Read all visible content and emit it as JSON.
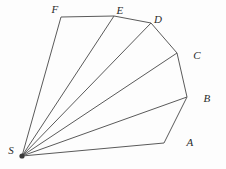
{
  "figure": {
    "kind": "geometry-diagram",
    "title": "",
    "background_color": "#fdfdfd",
    "stroke_color": "#5a5a5a",
    "label_color": "#2b2b2b",
    "apex_point_color": "#3a3a3a",
    "width": 226,
    "height": 169
  },
  "chart_data": {
    "type": "scatter",
    "title": "",
    "xlabel": "",
    "ylabel": "",
    "grid": false,
    "legend": null,
    "points": [
      {
        "label": "S",
        "x": 22,
        "y": 156,
        "label_x": 11,
        "label_y": 150
      },
      {
        "label": "A",
        "x": 164,
        "y": 143,
        "label_x": 190,
        "label_y": 142
      },
      {
        "label": "B",
        "x": 187,
        "y": 97,
        "label_x": 207,
        "label_y": 98
      },
      {
        "label": "C",
        "x": 177,
        "y": 53,
        "label_x": 197,
        "label_y": 55
      },
      {
        "label": "D",
        "x": 151,
        "y": 23,
        "label_x": 158,
        "label_y": 19
      },
      {
        "label": "E",
        "x": 114,
        "y": 16,
        "label_x": 120,
        "label_y": 10
      },
      {
        "label": "F",
        "x": 61,
        "y": 17,
        "label_x": 55,
        "label_y": 9
      }
    ],
    "polygon_outline": [
      "S",
      "A",
      "B",
      "C",
      "D",
      "E",
      "F"
    ],
    "diagonals": [
      {
        "from": "S",
        "to": "B"
      },
      {
        "from": "S",
        "to": "C"
      },
      {
        "from": "S",
        "to": "D"
      },
      {
        "from": "S",
        "to": "E"
      }
    ],
    "vertex_labels": [
      "S",
      "A",
      "B",
      "C",
      "D",
      "E",
      "F"
    ],
    "triangle_count": 5,
    "triangles": [
      [
        "S",
        "A",
        "B"
      ],
      [
        "S",
        "B",
        "C"
      ],
      [
        "S",
        "C",
        "D"
      ],
      [
        "S",
        "D",
        "E"
      ],
      [
        "S",
        "E",
        "F"
      ]
    ]
  }
}
